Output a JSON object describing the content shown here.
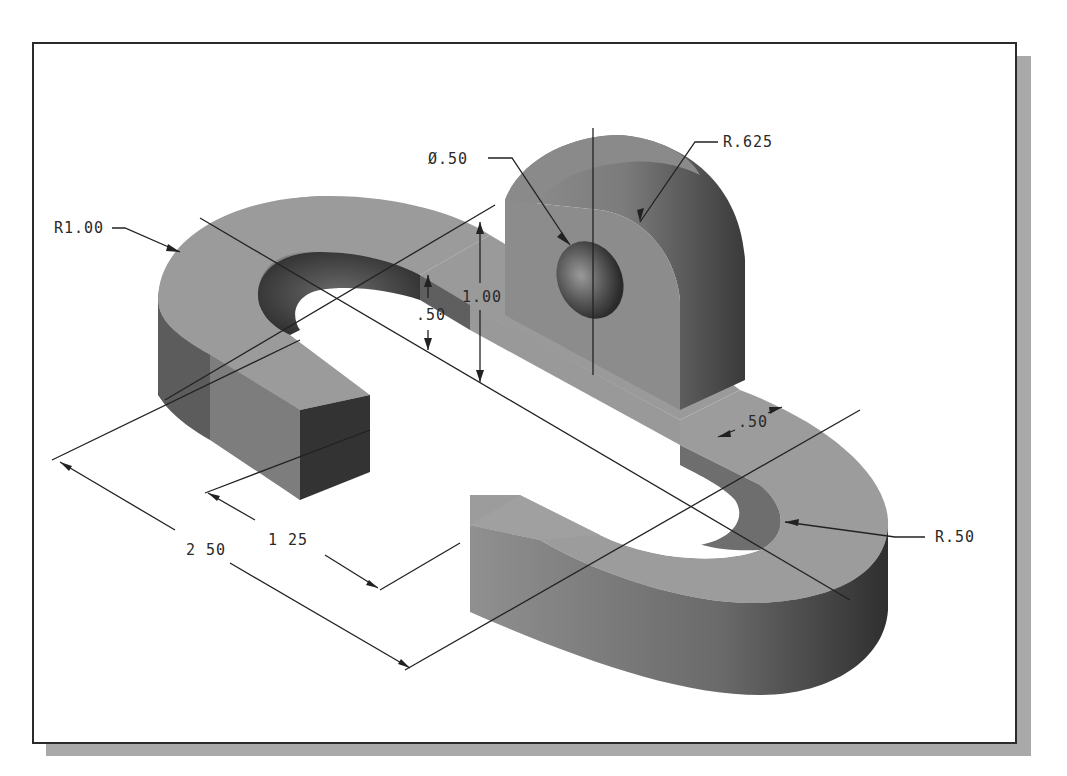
{
  "figure": {
    "type": "isometric shaded CAD part drawing",
    "frame": {
      "border_color": "#2b2b2b",
      "shadow_color": "#a9a9a9",
      "background": "#ffffff"
    },
    "part_colors": {
      "top_face": "#9a9a9a",
      "side_light": "#8a8a8a",
      "side_dark": "#3e3e3e",
      "hole": "#555555"
    }
  },
  "dimensions": {
    "outer_radius": "R1.00",
    "hole_diameter": "Ø.50",
    "boss_radius": "R.625",
    "total_height": "1.00",
    "base_thickness": ".50",
    "wall_width": ".50",
    "inner_radius": "R.50",
    "opening_length": "1.25",
    "overall_length": "2.50"
  },
  "display_labels": {
    "outer_radius": "R1.00",
    "hole_diameter": "Ø.50",
    "boss_radius": "R.625",
    "total_height": "1.00",
    "base_thickness": ".50",
    "wall_width": ".50",
    "inner_radius": "R.50",
    "opening_length": "1 25",
    "overall_length": "2 50"
  }
}
